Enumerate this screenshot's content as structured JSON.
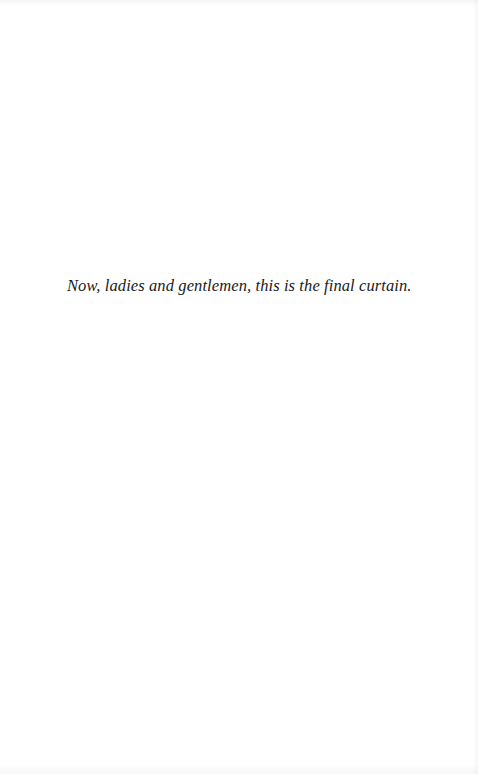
{
  "page": {
    "epigraph": "Now, ladies and gentlemen, this is the final curtain."
  },
  "colors": {
    "background": "#ffffff",
    "text": "#1a1a1a"
  }
}
